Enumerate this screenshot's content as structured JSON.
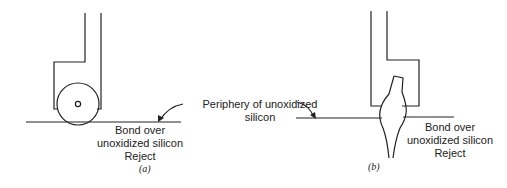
{
  "figure": {
    "panel_a": {
      "caption": "(a)",
      "label_line1": "Bond over",
      "label_line2": "unoxidized silicon",
      "label_line3": "Reject"
    },
    "panel_b": {
      "caption": "(b)",
      "label_line1": "Bond over",
      "label_line2": "unoxidized silicon",
      "label_line3": "Reject"
    },
    "shared_label_line1": "Periphery of unoxidized",
    "shared_label_line2": "silicon",
    "stroke_color": "#222222",
    "background_color": "#ffffff"
  }
}
